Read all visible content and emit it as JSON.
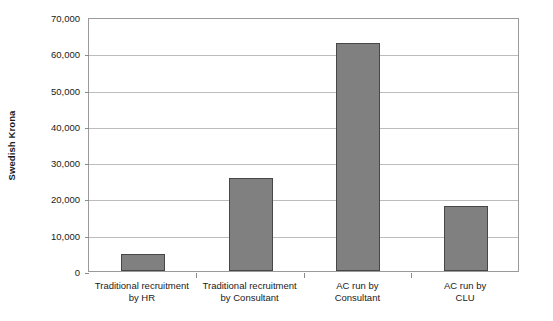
{
  "chart_data": {
    "type": "bar",
    "title": "",
    "xlabel": "",
    "ylabel": "Swedish Krona",
    "categories": [
      "Traditional recruitment by HR",
      "Traditional recruitment by Consultant",
      "AC run by Consultant",
      "AC run by CLU"
    ],
    "category_lines": [
      [
        "Traditional recruitment",
        "by HR"
      ],
      [
        "Traditional recruitment",
        "by Consultant"
      ],
      [
        "AC run by",
        "Consultant"
      ],
      [
        "AC run by",
        "CLU"
      ]
    ],
    "values": [
      4800,
      25500,
      62800,
      18000
    ],
    "ylim": [
      0,
      70000
    ],
    "ytick_values": [
      0,
      10000,
      20000,
      30000,
      40000,
      50000,
      60000,
      70000
    ],
    "ytick_labels": [
      "0",
      "10,000",
      "20,000",
      "30,000",
      "40,000",
      "50,000",
      "60,000",
      "70,000"
    ],
    "grid": true,
    "legend": "none",
    "bar_color": "#808080",
    "bar_edge_color": "#474747",
    "gridline_color": "#bcbcbc",
    "plot_border_color": "#9a9a9a"
  }
}
